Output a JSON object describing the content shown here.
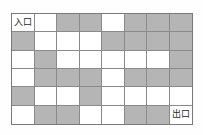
{
  "figure": {
    "kind": "maze-grid-diagram",
    "rows": 6,
    "columns": 8,
    "entrance_label": "入口",
    "exit_label": "出口",
    "entrance_cell": [
      0,
      0
    ],
    "exit_cell": [
      5,
      7
    ],
    "colors": {
      "blocked_cell": "#b5b5b5",
      "open_cell": "#ffffff",
      "grid_line": "#8a8a8a",
      "outer_border": "#7a7a7a",
      "label_text": "#2b2b2b",
      "background": "#fefefe"
    },
    "legend": {
      "open": "white cell (passable)",
      "blocked": "gray cell (wall)"
    },
    "cells": [
      [
        {
          "state": "open",
          "label": "入口"
        },
        {
          "state": "open",
          "label": ""
        },
        {
          "state": "blocked",
          "label": ""
        },
        {
          "state": "blocked",
          "label": ""
        },
        {
          "state": "open",
          "label": ""
        },
        {
          "state": "blocked",
          "label": ""
        },
        {
          "state": "blocked",
          "label": ""
        },
        {
          "state": "blocked",
          "label": ""
        }
      ],
      [
        {
          "state": "blocked",
          "label": ""
        },
        {
          "state": "open",
          "label": ""
        },
        {
          "state": "open",
          "label": ""
        },
        {
          "state": "open",
          "label": ""
        },
        {
          "state": "blocked",
          "label": ""
        },
        {
          "state": "blocked",
          "label": ""
        },
        {
          "state": "blocked",
          "label": ""
        },
        {
          "state": "blocked",
          "label": ""
        }
      ],
      [
        {
          "state": "open",
          "label": ""
        },
        {
          "state": "blocked",
          "label": ""
        },
        {
          "state": "open",
          "label": ""
        },
        {
          "state": "open",
          "label": ""
        },
        {
          "state": "open",
          "label": ""
        },
        {
          "state": "open",
          "label": ""
        },
        {
          "state": "open",
          "label": ""
        },
        {
          "state": "blocked",
          "label": ""
        }
      ],
      [
        {
          "state": "open",
          "label": ""
        },
        {
          "state": "blocked",
          "label": ""
        },
        {
          "state": "blocked",
          "label": ""
        },
        {
          "state": "blocked",
          "label": ""
        },
        {
          "state": "open",
          "label": ""
        },
        {
          "state": "blocked",
          "label": ""
        },
        {
          "state": "blocked",
          "label": ""
        },
        {
          "state": "blocked",
          "label": ""
        }
      ],
      [
        {
          "state": "blocked",
          "label": ""
        },
        {
          "state": "open",
          "label": ""
        },
        {
          "state": "open",
          "label": ""
        },
        {
          "state": "blocked",
          "label": ""
        },
        {
          "state": "open",
          "label": ""
        },
        {
          "state": "open",
          "label": ""
        },
        {
          "state": "open",
          "label": ""
        },
        {
          "state": "open",
          "label": ""
        }
      ],
      [
        {
          "state": "open",
          "label": ""
        },
        {
          "state": "blocked",
          "label": ""
        },
        {
          "state": "blocked",
          "label": ""
        },
        {
          "state": "open",
          "label": ""
        },
        {
          "state": "open",
          "label": ""
        },
        {
          "state": "blocked",
          "label": ""
        },
        {
          "state": "blocked",
          "label": ""
        },
        {
          "state": "open",
          "label": "出口"
        }
      ]
    ]
  }
}
